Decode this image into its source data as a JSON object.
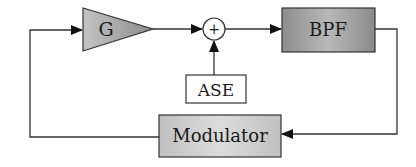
{
  "diagram": {
    "type": "block-diagram",
    "blocks": {
      "gain": {
        "label": "G",
        "shape": "triangle"
      },
      "sum": {
        "label": "+",
        "shape": "circle"
      },
      "bpf": {
        "label": "BPF",
        "shape": "rectangle"
      },
      "ase": {
        "label": "ASE",
        "shape": "rectangle"
      },
      "modulator": {
        "label": "Modulator",
        "shape": "rectangle"
      }
    },
    "connections": [
      {
        "from": "G",
        "to": "+"
      },
      {
        "from": "+",
        "to": "BPF"
      },
      {
        "from": "ASE",
        "to": "+"
      },
      {
        "from": "BPF",
        "to": "Modulator"
      },
      {
        "from": "Modulator",
        "to": "G"
      }
    ],
    "colors": {
      "line": "#333333",
      "block_fill_light": "#d4d4d4",
      "block_fill_dark": "#8a8a8a",
      "plain_fill": "#ffffff"
    }
  }
}
